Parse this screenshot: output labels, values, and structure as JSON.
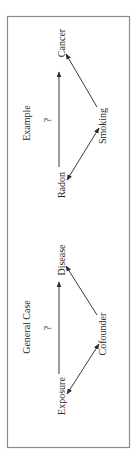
{
  "diagram": {
    "orientation": "rotated-90-ccw",
    "panels": [
      {
        "title": "Example",
        "question_mark": "?",
        "nodes": {
          "exposure": "Radon",
          "outcome": "Cancer",
          "confounder": "Smoking"
        },
        "edges": [
          {
            "from": "Radon",
            "to": "Cancer",
            "type": "directed"
          },
          {
            "from": "Smoking",
            "to": "Cancer",
            "type": "directed"
          },
          {
            "from": "Radon",
            "to": "Smoking",
            "type": "bidirected"
          }
        ]
      },
      {
        "title": "General Case",
        "question_mark": "?",
        "nodes": {
          "exposure": "Exposure",
          "outcome": "Disease",
          "confounder": "Cofounder"
        },
        "edges": [
          {
            "from": "Exposure",
            "to": "Disease",
            "type": "directed"
          },
          {
            "from": "Cofounder",
            "to": "Disease",
            "type": "directed"
          },
          {
            "from": "Exposure",
            "to": "Cofounder",
            "type": "bidirected"
          }
        ]
      }
    ],
    "colors": {
      "frame": "#8a8a8a",
      "line": "#3a3a3a",
      "text": "#2a2a2a"
    }
  }
}
